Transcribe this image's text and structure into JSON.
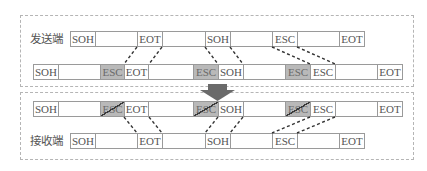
{
  "colors": {
    "cell_border": "#9a9a9a",
    "escape_fill": "#b9b9b9",
    "text": "#555555",
    "connector": "#333333",
    "arrow": "#6a6a6a",
    "panel_border": "#b5b5b5"
  },
  "sender": {
    "label": "发送端",
    "frame": [
      {
        "text": "SOH",
        "type": "ctrl"
      },
      {
        "text": "",
        "type": "data"
      },
      {
        "text": "EOT",
        "type": "ctrl"
      },
      {
        "text": "",
        "type": "data"
      },
      {
        "text": "SOH",
        "type": "ctrl"
      },
      {
        "text": "",
        "type": "data"
      },
      {
        "text": "ESC",
        "type": "ctrl"
      },
      {
        "text": "",
        "type": "data"
      },
      {
        "text": "EOT",
        "type": "ctrl"
      }
    ]
  },
  "stuffed": {
    "frame": [
      {
        "text": "SOH",
        "type": "ctrl"
      },
      {
        "text": "",
        "type": "data"
      },
      {
        "text": "ESC",
        "type": "inserted"
      },
      {
        "text": "EOT",
        "type": "ctrl"
      },
      {
        "text": "",
        "type": "data"
      },
      {
        "text": "ESC",
        "type": "inserted"
      },
      {
        "text": "SOH",
        "type": "ctrl"
      },
      {
        "text": "",
        "type": "data"
      },
      {
        "text": "ESC",
        "type": "inserted"
      },
      {
        "text": "ESC",
        "type": "ctrl"
      },
      {
        "text": "",
        "type": "data"
      },
      {
        "text": "EOT",
        "type": "ctrl"
      }
    ]
  },
  "received": {
    "frame": [
      {
        "text": "SOH",
        "type": "ctrl"
      },
      {
        "text": "",
        "type": "data"
      },
      {
        "text": "ESC",
        "type": "removed"
      },
      {
        "text": "EOT",
        "type": "ctrl"
      },
      {
        "text": "",
        "type": "data"
      },
      {
        "text": "ESC",
        "type": "removed"
      },
      {
        "text": "SOH",
        "type": "ctrl"
      },
      {
        "text": "",
        "type": "data"
      },
      {
        "text": "ESC",
        "type": "removed"
      },
      {
        "text": "ESC",
        "type": "ctrl"
      },
      {
        "text": "",
        "type": "data"
      },
      {
        "text": "EOT",
        "type": "ctrl"
      }
    ]
  },
  "receiver": {
    "label": "接收端",
    "frame": [
      {
        "text": "SOH",
        "type": "ctrl"
      },
      {
        "text": "",
        "type": "data"
      },
      {
        "text": "EOT",
        "type": "ctrl"
      },
      {
        "text": "",
        "type": "data"
      },
      {
        "text": "SOH",
        "type": "ctrl"
      },
      {
        "text": "",
        "type": "data"
      },
      {
        "text": "ESC",
        "type": "ctrl"
      },
      {
        "text": "",
        "type": "data"
      },
      {
        "text": "EOT",
        "type": "ctrl"
      }
    ]
  }
}
